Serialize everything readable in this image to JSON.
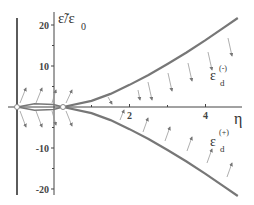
{
  "chart_data": {
    "type": "line",
    "title": "",
    "xlabel": "η",
    "ylabel": "ε̃/ε0",
    "ylabel_main": "ε̃/ε",
    "ylabel_sub": "0",
    "xlim": [
      -1,
      5
    ],
    "ylim": [
      -22,
      23
    ],
    "x_ticks": [
      {
        "value": 2,
        "label": "2"
      },
      {
        "value": 4,
        "label": "4"
      }
    ],
    "y_ticks": [
      {
        "value": 20,
        "label": "20"
      },
      {
        "value": 10,
        "label": "10"
      },
      {
        "value": -10,
        "label": "-10"
      },
      {
        "value": -20,
        "label": "-20"
      }
    ],
    "grid": false,
    "series": [
      {
        "name": "ε_d^(-)",
        "label_main": "ε",
        "label_sub": "d",
        "label_sup": "(-)",
        "x": [
          0.25,
          1,
          1.5,
          2,
          2.5,
          3,
          3.5,
          4,
          4.5,
          4.85
        ],
        "y": [
          0,
          1.5,
          3.2,
          5.4,
          7.8,
          10.5,
          13.3,
          16.3,
          19.5,
          21.7
        ]
      },
      {
        "name": "ε_d^(+)",
        "label_main": "ε",
        "label_sub": "d",
        "label_sup": "(+)",
        "x": [
          0.25,
          1,
          1.5,
          2,
          2.5,
          3,
          3.5,
          4,
          4.5,
          4.85
        ],
        "y": [
          0,
          -1.5,
          -3.2,
          -5.4,
          -7.8,
          -10.5,
          -13.3,
          -16.3,
          -19.5,
          -21.7
        ]
      },
      {
        "name": "inner-branches",
        "x": [
          -0.95,
          -0.5,
          0,
          0.25
        ],
        "y_upper": [
          0,
          0.8,
          0.6,
          0
        ],
        "y_lower": [
          0,
          -0.8,
          -0.6,
          0
        ]
      }
    ],
    "annotations": [
      "flow arrows pointing toward curves",
      "vertical line at η≈-0.95"
    ]
  }
}
